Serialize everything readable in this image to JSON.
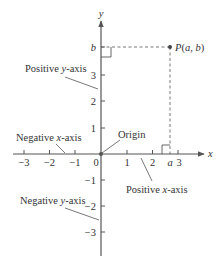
{
  "diagram": {
    "title": "",
    "axes": {
      "x_label": "x",
      "y_label": "y",
      "x_ticks": [
        {
          "value": -3,
          "label": "−3"
        },
        {
          "value": -2,
          "label": "−2"
        },
        {
          "value": -1,
          "label": "−1"
        },
        {
          "value": 0,
          "label": "0"
        },
        {
          "value": 1,
          "label": "1"
        },
        {
          "value": 2,
          "label": "2"
        },
        {
          "value": 3,
          "label": "3"
        }
      ],
      "y_ticks": [
        {
          "value": 3,
          "label": "3"
        },
        {
          "value": 2,
          "label": "2"
        },
        {
          "value": 1,
          "label": "1"
        },
        {
          "value": -1,
          "label": "−1"
        },
        {
          "value": -2,
          "label": "−2"
        },
        {
          "value": -3,
          "label": "−3"
        }
      ],
      "x_range": [
        -3.8,
        3.9
      ],
      "y_range": [
        -3.9,
        5.1
      ]
    },
    "point": {
      "label": "P(a, b)",
      "x_symbol": "a",
      "y_symbol": "b",
      "x_approx": 2.7,
      "y_approx": 4.2
    },
    "annotations": {
      "positive_y_axis": "Positive y-axis",
      "negative_x_axis": "Negative x-axis",
      "origin": "Origin",
      "positive_x_axis": "Positive x-axis",
      "negative_y_axis": "Negative y-axis"
    },
    "colors": {
      "axis": "#555555",
      "text": "#333333",
      "point": "#444444"
    }
  }
}
